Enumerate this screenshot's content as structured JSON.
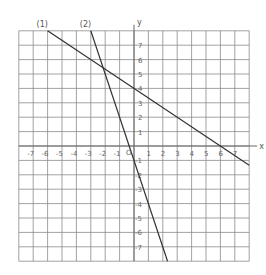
{
  "chart_data": {
    "type": "line",
    "title": "",
    "xlabel": "x",
    "ylabel": "y",
    "xlim": [
      -8,
      8
    ],
    "ylim": [
      -8,
      8
    ],
    "grid": true,
    "origin_label": "O",
    "x_ticks": [
      "-7",
      "-6",
      "-5",
      "-4",
      "-3",
      "-2",
      "-1",
      "1",
      "2",
      "3",
      "4",
      "5",
      "6",
      "7"
    ],
    "y_ticks": [
      "7",
      "6",
      "5",
      "4",
      "3",
      "2",
      "1",
      "-1",
      "-2",
      "-3",
      "-4",
      "-5",
      "-6",
      "-7"
    ],
    "series": [
      {
        "name": "(1)",
        "equation": "y = -2/3 x + 4",
        "x": [
          -6,
          8
        ],
        "y": [
          8,
          -1.33
        ]
      },
      {
        "name": "(2)",
        "equation": "y = -3x - 1",
        "x": [
          -3,
          2.33
        ],
        "y": [
          8,
          -8
        ]
      }
    ],
    "legend": {
      "labels": [
        "(1)",
        "(2)"
      ],
      "position": "above lines at top"
    }
  }
}
